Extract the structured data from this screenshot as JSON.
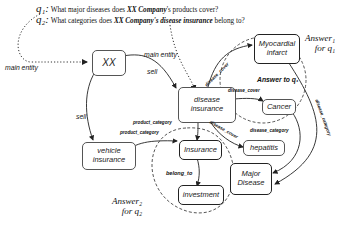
{
  "questions": [
    {
      "symbol": "q₁:",
      "text_before": " What major diseases does ",
      "entity": "XX Company",
      "text_after": "'s products cover?"
    },
    {
      "symbol": "q₂:",
      "text_before": " What categories does ",
      "entity": "XX Company's disease insurance",
      "text_after": " belong to?"
    }
  ],
  "nodes": {
    "xx": "XX",
    "disease_insurance": "disease insurance",
    "vehicle_insurance": "vehicle insurance",
    "myocardial_infarct": "Myocardial infarct",
    "cancer": "Cancer",
    "hepatitis": "hepatitis",
    "insurance": "Insurance",
    "investment": "investment",
    "major_disease": "Major Disease"
  },
  "edges": {
    "main_entity_1": "main entity",
    "main_entity_2": "main entity",
    "sell_1": "sell",
    "sell_2": "sell",
    "disease_cover_1": "disease_cover",
    "disease_cover_2": "disease_cover",
    "disease_cover_3": "disease_cover",
    "disease_category_1": "disease_category",
    "disease_category_2": "disease_category",
    "product_category_1": "product_category",
    "product_category_2": "product_category",
    "belong_to": "belong_to"
  },
  "answers": {
    "answer1": "Answer₁ for q₁",
    "answer1_line1": "Answer₁",
    "answer1_line2": "for q₁",
    "answer_to_q1": "Answer to q₁",
    "answer2_line1": "Answer₂",
    "answer2_line2": "for q₂"
  }
}
